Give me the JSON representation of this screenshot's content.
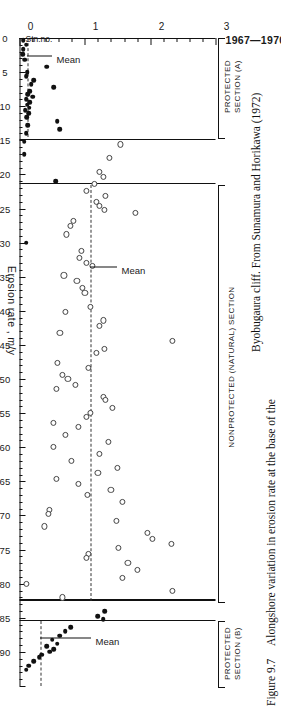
{
  "figure": {
    "number": "Figure 9.7",
    "caption_line1": "Alongshore variation in erosion rate at the base of the",
    "caption_line2": "Byobugaura cliff. From Sunamura and Horikawa (1972)"
  },
  "plot": {
    "title": "1967—1970",
    "y_axis_title": "Erosion rate , m/y",
    "station_axis_tag": "Stn.no.",
    "mean_label": "Mean"
  },
  "axes": {
    "erosion": {
      "label": "Erosion rate , m/y",
      "unit": "m/y",
      "min": 0,
      "max": 3,
      "ticks": [
        0,
        1,
        2,
        3
      ],
      "tick_labels": [
        "0",
        "1",
        "2",
        "3"
      ],
      "minor_step": 0.2
    },
    "station": {
      "label": "Stn.no.",
      "min": 0,
      "max": 95,
      "ticks": [
        0,
        5,
        10,
        15,
        20,
        25,
        30,
        35,
        40,
        45,
        50,
        55,
        60,
        65,
        70,
        75,
        80,
        85,
        90
      ],
      "tick_labels": [
        "0",
        "5",
        "10",
        "15",
        "20",
        "25",
        "30",
        "35",
        "40",
        "45",
        "50",
        "55",
        "60",
        "65",
        "70",
        "75",
        "80",
        "85",
        "90"
      ],
      "minor_step": 1
    }
  },
  "sections": [
    {
      "name": "protected-a",
      "label_line1": "PROTECTED",
      "label_line2": "SECTION (A)",
      "station_start": 0,
      "station_end": 14.5,
      "mean": 0.12
    },
    {
      "name": "nonprotected",
      "label_line1": "NONPROTECTED (NATURAL) SECTION",
      "label_line2": "",
      "station_start": 21.5,
      "station_end": 82.5,
      "mean": 1.08
    },
    {
      "name": "protected-b",
      "label_line1": "PROTECTED",
      "label_line2": "SECTION (B)",
      "station_start": 85.5,
      "station_end": 95,
      "mean": 0.32
    }
  ],
  "dividers": [
    14.8,
    21.3,
    82.3,
    85.3
  ],
  "mean_callouts": [
    {
      "section": "protected-a",
      "station": 2.6,
      "erosion": 0.5
    },
    {
      "section": "nonprotected",
      "station": 33.5,
      "erosion": 1.5
    },
    {
      "section": "protected-b",
      "station": 88.0,
      "erosion": 1.1
    }
  ],
  "chart_data": {
    "type": "scatter",
    "title": "1967—1970",
    "xlabel": "Stn.no.",
    "ylabel": "Erosion rate , m/y",
    "xlim": [
      0,
      95
    ],
    "ylim": [
      0,
      3
    ],
    "grid": false,
    "legend": "none",
    "series": [
      {
        "name": "Protected sections (A and B) — filled circles",
        "marker": "filled-circle",
        "points": [
          [
            0.3,
            0.06
          ],
          [
            1.0,
            0.1
          ],
          [
            1.6,
            0.06
          ],
          [
            2.4,
            0.05
          ],
          [
            3.2,
            0.08
          ],
          [
            4.2,
            0.42
          ],
          [
            5.0,
            0.12
          ],
          [
            5.6,
            0.1
          ],
          [
            6.2,
            0.22
          ],
          [
            6.8,
            0.18
          ],
          [
            7.2,
            0.52
          ],
          [
            7.8,
            0.16
          ],
          [
            8.2,
            0.13
          ],
          [
            8.6,
            0.2
          ],
          [
            9.0,
            0.1
          ],
          [
            9.4,
            0.16
          ],
          [
            9.8,
            0.12
          ],
          [
            10.2,
            0.15
          ],
          [
            10.6,
            0.09
          ],
          [
            11.0,
            0.14
          ],
          [
            11.6,
            0.11
          ],
          [
            12.2,
            0.58
          ],
          [
            12.8,
            0.13
          ],
          [
            13.4,
            0.62
          ],
          [
            14.0,
            0.1
          ],
          [
            15.2,
            0.07
          ],
          [
            17.0,
            0.07
          ],
          [
            21.0,
            0.55
          ],
          [
            30.0,
            0.1
          ],
          [
            84.0,
            1.3
          ],
          [
            84.8,
            1.2
          ],
          [
            85.2,
            1.28
          ],
          [
            86.4,
            0.78
          ],
          [
            87.0,
            0.7
          ],
          [
            87.6,
            0.62
          ],
          [
            88.2,
            0.5
          ],
          [
            88.8,
            0.58
          ],
          [
            89.2,
            0.42
          ],
          [
            89.6,
            0.52
          ],
          [
            90.0,
            0.46
          ],
          [
            90.4,
            0.34
          ],
          [
            90.8,
            0.3
          ],
          [
            91.4,
            0.22
          ],
          [
            92.0,
            0.14
          ],
          [
            92.6,
            0.1
          ]
        ]
      },
      {
        "name": "Nonprotected (natural) section — open circles",
        "marker": "open-circle",
        "points": [
          [
            15.6,
            1.55
          ],
          [
            17.6,
            1.38
          ],
          [
            19.6,
            1.22
          ],
          [
            20.4,
            1.28
          ],
          [
            21.4,
            1.15
          ],
          [
            22.4,
            1.02
          ],
          [
            23.2,
            1.32
          ],
          [
            24.0,
            1.18
          ],
          [
            24.6,
            1.22
          ],
          [
            25.2,
            1.3
          ],
          [
            25.6,
            1.78
          ],
          [
            26.8,
            0.82
          ],
          [
            27.6,
            0.78
          ],
          [
            28.8,
            0.72
          ],
          [
            31.2,
            0.95
          ],
          [
            32.2,
            0.92
          ],
          [
            33.0,
            1.02
          ],
          [
            33.4,
            1.12
          ],
          [
            34.8,
            0.68
          ],
          [
            35.6,
            0.88
          ],
          [
            36.6,
            0.96
          ],
          [
            37.4,
            1.0
          ],
          [
            39.4,
            1.08
          ],
          [
            40.2,
            0.7
          ],
          [
            41.4,
            1.28
          ],
          [
            42.2,
            1.22
          ],
          [
            43.2,
            0.62
          ],
          [
            44.4,
            2.34
          ],
          [
            45.6,
            1.3
          ],
          [
            46.2,
            1.18
          ],
          [
            47.6,
            0.58
          ],
          [
            48.4,
            1.06
          ],
          [
            49.4,
            0.66
          ],
          [
            50.0,
            0.74
          ],
          [
            50.8,
            0.86
          ],
          [
            51.4,
            0.56
          ],
          [
            52.6,
            1.28
          ],
          [
            53.0,
            1.32
          ],
          [
            54.2,
            1.42
          ],
          [
            55.0,
            1.08
          ],
          [
            55.6,
            1.02
          ],
          [
            56.4,
            0.52
          ],
          [
            57.0,
            0.9
          ],
          [
            58.2,
            0.7
          ],
          [
            59.2,
            1.36
          ],
          [
            60.0,
            0.52
          ],
          [
            61.0,
            1.22
          ],
          [
            62.0,
            0.8
          ],
          [
            63.0,
            1.5
          ],
          [
            63.8,
            1.2
          ],
          [
            64.6,
            0.56
          ],
          [
            65.4,
            0.9
          ],
          [
            66.2,
            1.4
          ],
          [
            67.0,
            1.04
          ],
          [
            68.0,
            1.58
          ],
          [
            69.2,
            0.46
          ],
          [
            69.8,
            0.44
          ],
          [
            70.8,
            1.48
          ],
          [
            71.6,
            0.38
          ],
          [
            72.6,
            1.96
          ],
          [
            73.4,
            2.04
          ],
          [
            74.2,
            2.32
          ],
          [
            74.8,
            1.52
          ],
          [
            75.6,
            1.06
          ],
          [
            76.2,
            1.02
          ],
          [
            77.0,
            1.66
          ],
          [
            78.0,
            1.8
          ],
          [
            79.2,
            1.58
          ],
          [
            80.0,
            0.1
          ],
          [
            81.0,
            2.34
          ],
          [
            82.0,
            0.66
          ]
        ]
      }
    ],
    "annotations": [
      {
        "text": "Mean",
        "section": "protected-a",
        "value": 0.12
      },
      {
        "text": "Mean",
        "section": "nonprotected",
        "value": 1.08
      },
      {
        "text": "Mean",
        "section": "protected-b",
        "value": 0.32
      }
    ]
  }
}
